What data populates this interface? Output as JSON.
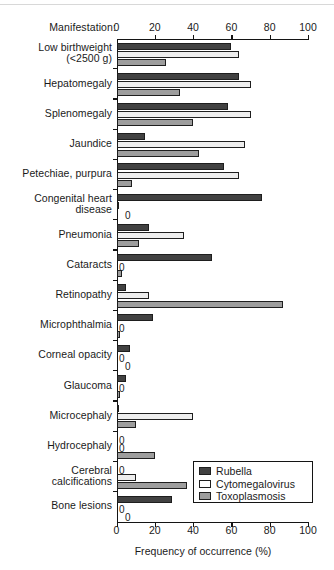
{
  "chart_data": {
    "type": "bar",
    "orientation": "horizontal",
    "title": "",
    "manifestation_header": "Manifestation:",
    "xlabel": "Frequency of occurrence (%)",
    "ylabel": "",
    "xlim": [
      0,
      100
    ],
    "xticks": [
      0,
      20,
      40,
      60,
      80,
      100
    ],
    "xtick_labels": [
      "0",
      "20",
      "40",
      "60",
      "80",
      "100"
    ],
    "grid": false,
    "legend_position": "bottom-right",
    "categories": [
      "Low birthweight\n(<2500 g)",
      "Hepatomegaly",
      "Splenomegaly",
      "Jaundice",
      "Petechiae, purpura",
      "Congenital heart\ndisease",
      "Pneumonia",
      "Cataracts",
      "Retinopathy",
      "Microphthalmia",
      "Corneal opacity",
      "Glaucoma",
      "Microcephaly",
      "Hydrocephaly",
      "Cerebral\ncalcifications",
      "Bone lesions"
    ],
    "series": [
      {
        "name": "Rubella",
        "color": "#414141",
        "values": [
          60,
          64,
          58,
          15,
          56,
          76,
          17,
          50,
          5,
          19,
          7,
          5,
          1,
          0,
          0,
          29
        ]
      },
      {
        "name": "Cytomegalovirus",
        "color": "#ededed",
        "values": [
          64,
          70,
          70,
          67,
          64,
          1,
          35,
          0,
          17,
          0,
          0,
          0,
          40,
          0,
          10,
          0
        ]
      },
      {
        "name": "Toxoplasmosis",
        "color": "#9d9d9d",
        "values": [
          26,
          33,
          40,
          43,
          8,
          0,
          12,
          3,
          87,
          2,
          0,
          2,
          10,
          20,
          37,
          0
        ]
      }
    ],
    "zero_annotations": [
      {
        "category": "Congenital heart\ndisease",
        "series": "Toxoplasmosis",
        "label": "0"
      },
      {
        "category": "Cataracts",
        "series": "Cytomegalovirus",
        "label": "0"
      },
      {
        "category": "Microphthalmia",
        "series": "Cytomegalovirus",
        "label": "0"
      },
      {
        "category": "Corneal opacity",
        "series": "Cytomegalovirus",
        "label": "0"
      },
      {
        "category": "Corneal opacity",
        "series": "Toxoplasmosis",
        "label": "0"
      },
      {
        "category": "Glaucoma",
        "series": "Cytomegalovirus",
        "label": "0"
      },
      {
        "category": "Hydrocephaly",
        "series": "Rubella",
        "label": "0"
      },
      {
        "category": "Hydrocephaly",
        "series": "Cytomegalovirus",
        "label": "0"
      },
      {
        "category": "Cerebral\ncalcifications",
        "series": "Rubella",
        "label": "0"
      },
      {
        "category": "Bone lesions",
        "series": "Cytomegalovirus",
        "label": "0"
      },
      {
        "category": "Bone lesions",
        "series": "Toxoplasmosis",
        "label": "0"
      }
    ]
  },
  "legend": {
    "items": [
      {
        "label": "Rubella",
        "key": "rubella"
      },
      {
        "label": "Cytomegalovirus",
        "key": "cmv"
      },
      {
        "label": "Toxoplasmosis",
        "key": "toxo"
      }
    ]
  }
}
